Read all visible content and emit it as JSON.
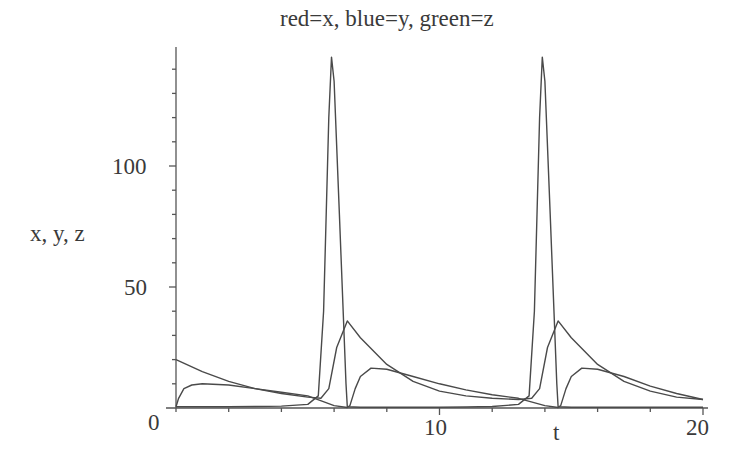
{
  "chart_data": {
    "type": "line",
    "title": "red=x, blue=y, green=z",
    "xlabel": "t",
    "ylabel": "x, y, z",
    "xlim": [
      0,
      20
    ],
    "ylim": [
      0,
      145
    ],
    "x_ticks": [
      0,
      10,
      20
    ],
    "y_ticks": [
      0,
      50,
      100
    ],
    "grid": false,
    "legend": "none (encoded in title)",
    "series": [
      {
        "name": "x",
        "color": "red",
        "t": [
          0,
          0.5,
          1,
          2,
          3,
          4,
          5,
          5.4,
          5.6,
          5.8,
          5.9,
          6.0,
          6.2,
          6.45,
          6.5,
          7,
          8,
          9,
          10,
          11,
          12,
          13,
          13.4,
          13.6,
          13.8,
          13.9,
          14.0,
          14.2,
          14.45,
          14.5,
          15,
          16,
          17,
          18,
          19,
          20
        ],
        "values": [
          0.5,
          0.5,
          0.5,
          0.5,
          0.6,
          0.8,
          1.5,
          5,
          40,
          120,
          145,
          135,
          80,
          10,
          0.5,
          0.3,
          0.3,
          0.3,
          0.3,
          0.4,
          0.6,
          1.5,
          5,
          40,
          120,
          145,
          135,
          80,
          10,
          0.5,
          0.3,
          0.3,
          0.3,
          0.3,
          0.3,
          0.3
        ]
      },
      {
        "name": "y",
        "color": "blue",
        "t": [
          0,
          1,
          2,
          3,
          4,
          5,
          5.5,
          5.8,
          6.1,
          6.5,
          7,
          8,
          9,
          10,
          11,
          12,
          13,
          13.5,
          13.8,
          14.1,
          14.5,
          15,
          16,
          17,
          18,
          19,
          20
        ],
        "values": [
          20,
          15,
          11,
          8,
          6,
          4.5,
          4,
          8,
          25,
          36,
          29,
          18,
          11,
          7,
          5,
          4,
          3.5,
          4,
          8,
          25,
          36,
          29,
          18,
          11,
          7,
          4.5,
          3.5
        ]
      },
      {
        "name": "z",
        "color": "green",
        "t": [
          0,
          0.1,
          0.3,
          0.6,
          1,
          2,
          3,
          4,
          5,
          6,
          6.5,
          6.6,
          6.8,
          7,
          7.4,
          8,
          9,
          10,
          11,
          12,
          13,
          14,
          14.5,
          14.6,
          14.8,
          15,
          15.4,
          16,
          17,
          18,
          19,
          20
        ],
        "values": [
          0.5,
          4,
          8,
          9.5,
          10,
          9.5,
          8,
          6.5,
          5,
          1,
          0.2,
          1,
          8,
          13,
          16.5,
          16,
          13,
          10,
          7.5,
          5.5,
          4,
          1,
          0.2,
          1,
          8,
          13,
          16.5,
          16,
          13,
          9,
          6,
          3.5
        ]
      }
    ]
  },
  "labels": {
    "title": "red=x, blue=y, green=z",
    "xlabel": "t",
    "ylabel": "x, y, z",
    "xtick_0": "0",
    "xtick_10": "10",
    "xtick_20": "20",
    "ytick_50": "50",
    "ytick_100": "100"
  }
}
